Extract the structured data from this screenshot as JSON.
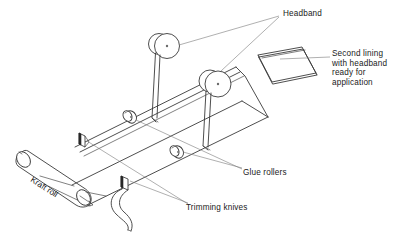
{
  "diagram": {
    "background_color": "#ffffff",
    "ink_color": "#1a1a1a",
    "line_color": "#3a3a3a",
    "leader_color": "#6e6e6e",
    "blade_color": "#2b2b2b",
    "labels": {
      "headband": "Headband",
      "second_lining": "Second lining\nwith headband\nready for\napplication",
      "glue_rollers": "Glue rollers",
      "trimming_knives": "Trimming knives",
      "kraft_roll": "Kraft roll"
    },
    "parts": [
      {
        "name": "kraft-roll",
        "label": "Kraft roll",
        "count": 1
      },
      {
        "name": "trimming-knife",
        "label": "Trimming knives",
        "count": 2
      },
      {
        "name": "glue-roller",
        "label": "Glue rollers",
        "count": 2
      },
      {
        "name": "headband-spool",
        "label": "Headband",
        "count": 2
      },
      {
        "name": "second-lining-panel",
        "label": "Second lining with headband ready for application",
        "count": 1
      }
    ]
  }
}
